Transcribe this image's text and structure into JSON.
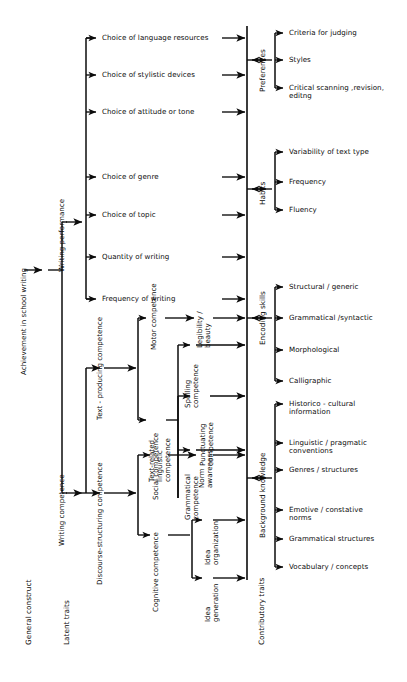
{
  "figure": {
    "root_label": "Achievement in school writing",
    "columns": [
      {
        "id": "general-construct",
        "label": "General construct"
      },
      {
        "id": "latent-traits",
        "label": "Latent traits"
      },
      {
        "id": "contributory-traits",
        "label": "Contributory traits"
      }
    ]
  },
  "level1": [
    {
      "id": "writing-performance",
      "label": "Writing performance"
    },
    {
      "id": "writing-competence",
      "label": "Writing competence"
    }
  ],
  "performance_items": [
    {
      "label": "Choice of language resources"
    },
    {
      "label": "Choice of stylistic devices"
    },
    {
      "label": "Choice of attitude or tone"
    },
    {
      "label": "Choice of genre"
    },
    {
      "label": "Choice of topic"
    },
    {
      "label": "Quantity of writing"
    },
    {
      "label": "Frequency of writing"
    }
  ],
  "competence_branches": [
    {
      "id": "text-producing",
      "label": "Text - producing competence"
    },
    {
      "id": "discourse-structuring",
      "label": "Discourse-structuring competence"
    }
  ],
  "text_producing_children": [
    {
      "id": "motor",
      "label": "Motor competence"
    },
    {
      "id": "text-related-linguistic",
      "label": "Text-related\nlinguistic\ncompetence"
    }
  ],
  "linguistic_children": [
    {
      "id": "spelling",
      "label": "Spelling\ncompetence"
    },
    {
      "id": "punctuating",
      "label": "Punctuating\ncompetence"
    },
    {
      "id": "grammatical",
      "label": "Grammatical\ncompetence"
    }
  ],
  "motor_children": [
    {
      "id": "legibility",
      "label": "Legibility /\nbeauty"
    }
  ],
  "discourse_children": [
    {
      "id": "social",
      "label": "Social competence"
    },
    {
      "id": "cognitive",
      "label": "Cognitive competence"
    }
  ],
  "social_children": [
    {
      "id": "norm-awareness",
      "label": "Norm\nawareness"
    }
  ],
  "cognitive_children": [
    {
      "id": "idea-organization",
      "label": "Idea\norganization"
    },
    {
      "id": "idea-generation",
      "label": "Idea\ngeneration"
    }
  ],
  "contributory_groups": [
    {
      "id": "preferences",
      "label": "Preferences",
      "items": [
        "Criteria for judging",
        "Styles",
        "Critical scanning ,revision,\neditng"
      ]
    },
    {
      "id": "habits",
      "label": "Habits",
      "items": [
        "Variability of text type",
        "Frequency",
        "Fluency"
      ]
    },
    {
      "id": "encoding-skills",
      "label": "Encoding skills",
      "items": [
        "Structural / generic",
        "Grammatical /syntactic",
        "Morphological",
        "Calligraphic"
      ]
    },
    {
      "id": "background-knowledge",
      "label": "Background knowledge",
      "items": [
        "Historico - cultural\ninformation",
        "Linguistic / pragmatic\nconventions",
        "Genres / structures",
        "Emotive / constative\nnorms",
        "Grammatical  structures",
        "Vocabulary / concepts"
      ]
    }
  ],
  "colors": {
    "ink": "#0b0b0b",
    "background": "#ffffff"
  }
}
